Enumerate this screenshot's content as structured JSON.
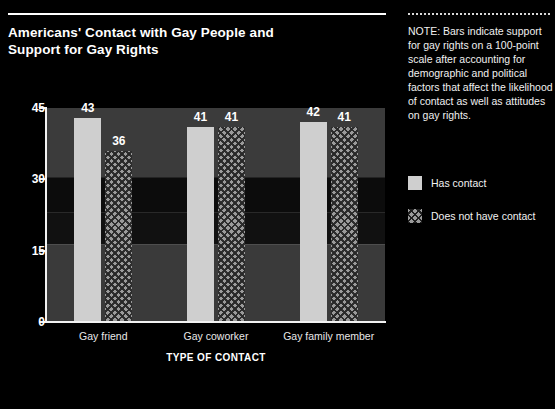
{
  "title": "Americans' Contact with Gay People and\nSupport for Gay Rights",
  "note": {
    "text": "NOTE: Bars indicate support for gay rights on a 100-point scale after accounting for demographic and political factors that affect the likelihood of contact as well as attitudes on gay rights."
  },
  "legend": {
    "items": [
      {
        "label": "Has contact",
        "style": "solid",
        "color": "#cfcfcf"
      },
      {
        "label": "Does not have contact",
        "style": "hatched",
        "color": "#9a9a9a"
      }
    ]
  },
  "chart_data": {
    "type": "bar",
    "title": "Americans' Contact with Gay People and Support for Gay Rights",
    "xlabel": "TYPE OF CONTACT",
    "ylabel": "",
    "ylim": [
      0,
      45
    ],
    "yticks": [
      0,
      15,
      30,
      45
    ],
    "ytick_labels": [
      "0",
      "15",
      "30",
      "45"
    ],
    "grid": false,
    "legend_position": "right",
    "categories": [
      "Gay friend",
      "Gay coworker",
      "Gay family member"
    ],
    "series": [
      {
        "name": "Has contact",
        "values": [
          43,
          41,
          42
        ]
      },
      {
        "name": "Does not have contact",
        "values": [
          36,
          41,
          41
        ]
      }
    ]
  },
  "colors": {
    "background": "#000000",
    "plot_background": "#3b3b3b",
    "axis": "#f2f2f2",
    "text": "#ffffff",
    "bar_solid": "#cfcfcf",
    "bar_hatched": "#9a9a9a"
  }
}
